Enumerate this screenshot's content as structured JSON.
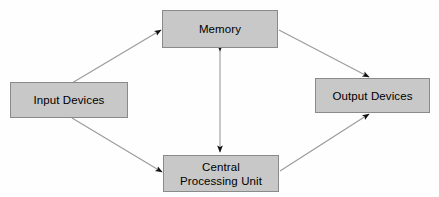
{
  "diagram": {
    "background_color": "#fefefe",
    "box_fill_color": "#c8c8c8",
    "box_border_color": "#8a8a8a",
    "line_color": "#9a9a9a",
    "arrowhead_color": "#111111",
    "text_color": "#000000",
    "nodes": [
      {
        "id": "memory",
        "label": "Memory",
        "x": 162,
        "y": 10,
        "width": 116,
        "height": 38
      },
      {
        "id": "input",
        "label": "Input Devices",
        "x": 10,
        "y": 82,
        "width": 118,
        "height": 36
      },
      {
        "id": "output",
        "label": "Output Devices",
        "x": 315,
        "y": 78,
        "width": 115,
        "height": 35
      },
      {
        "id": "cpu",
        "label": "Central\nProcessing Unit",
        "x": 163,
        "y": 155,
        "width": 116,
        "height": 37
      }
    ],
    "edges": [
      {
        "id": "input-to-memory",
        "from": "input",
        "to": "memory",
        "direction": "forward",
        "x1": 72,
        "y1": 83,
        "x2": 161,
        "y2": 30
      },
      {
        "id": "input-to-cpu",
        "from": "input",
        "to": "cpu",
        "direction": "forward",
        "x1": 72,
        "y1": 118,
        "x2": 162,
        "y2": 172
      },
      {
        "id": "memory-to-output",
        "from": "memory",
        "to": "output",
        "direction": "forward",
        "x1": 279,
        "y1": 30,
        "x2": 369,
        "y2": 77
      },
      {
        "id": "cpu-to-output",
        "from": "cpu",
        "to": "output",
        "direction": "forward",
        "x1": 280,
        "y1": 171,
        "x2": 369,
        "y2": 114
      },
      {
        "id": "memory-cpu-bidirectional",
        "from": "memory",
        "to": "cpu",
        "direction": "both",
        "x1": 220,
        "y1": 49,
        "x2": 220,
        "y2": 154
      }
    ]
  }
}
